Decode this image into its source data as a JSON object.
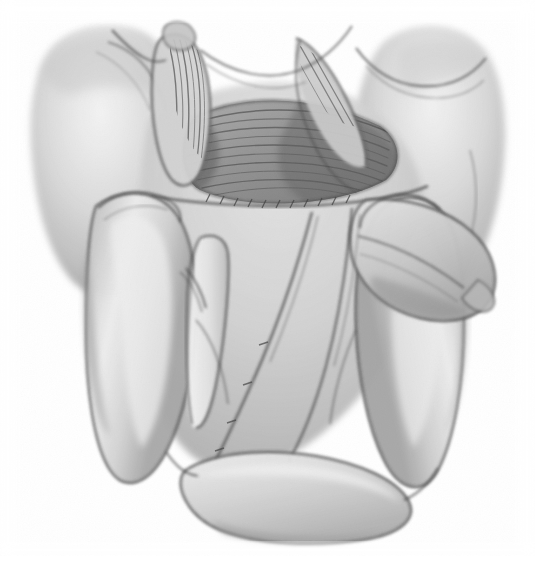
{
  "figure": {
    "kind": "anatomical-illustration",
    "view": "posterior-superior dissection view",
    "medium": "grayscale pencil / airbrush rendering",
    "background_color": "#ffffff",
    "ink_color": "#3a3a3a",
    "midtone_color": "#b4b4b4",
    "shadow_color": "#6e6e6e",
    "highlight_color": "#f2f2f2",
    "width": 535,
    "height": 574
  },
  "caption": {
    "text": "",
    "note": "caption line is cropped by the bottom edge and is illegible"
  }
}
